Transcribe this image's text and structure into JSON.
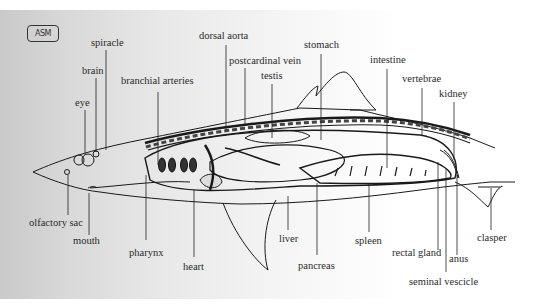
{
  "diagram": {
    "logo_text": "ASM",
    "labels": {
      "spiracle": "spiracle",
      "brain": "brain",
      "eye": "eye",
      "branchial_arteries": "branchial arteries",
      "dorsal_aorta": "dorsal aorta",
      "postcardinal_vein": "postcardinal vein",
      "testis": "testis",
      "stomach": "stomach",
      "intestine": "intestine",
      "vertebrae": "vertebrae",
      "kidney": "kidney",
      "olfactory_sac": "olfactory sac",
      "mouth": "mouth",
      "pharynx": "pharynx",
      "heart": "heart",
      "liver": "liver",
      "pancreas": "pancreas",
      "spleen": "spleen",
      "rectal_gland": "rectal gland",
      "anus": "anus",
      "seminal_vescicle": "seminal vescicle",
      "clasper": "clasper"
    }
  }
}
